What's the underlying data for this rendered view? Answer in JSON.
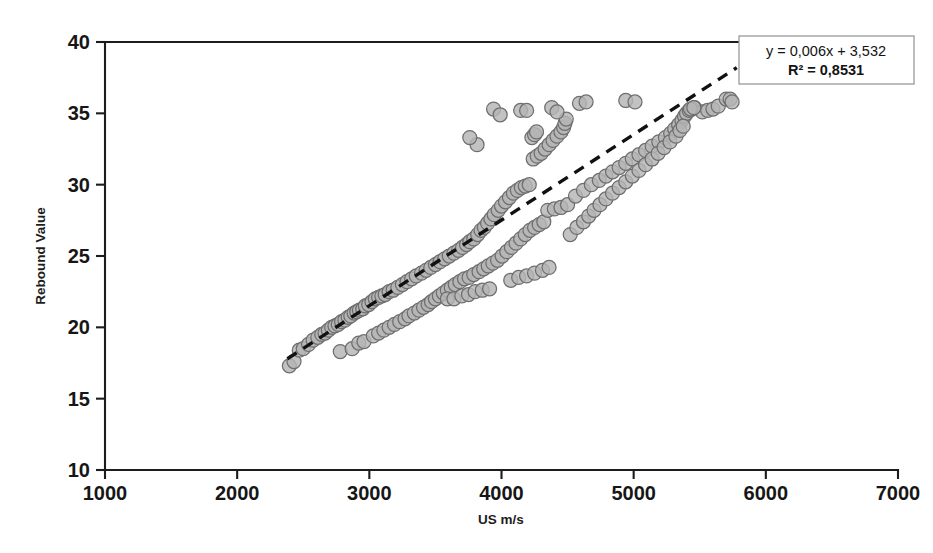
{
  "chart_data": {
    "type": "scatter",
    "title": "",
    "xlabel": "US m/s",
    "ylabel": "Rebound Value",
    "xlim": [
      1000,
      7000
    ],
    "ylim": [
      10,
      40
    ],
    "xticks": [
      1000,
      2000,
      3000,
      4000,
      5000,
      6000,
      7000
    ],
    "yticks": [
      10,
      15,
      20,
      25,
      30,
      35,
      40
    ],
    "xtick_labels": [
      "1000",
      "2000",
      "3000",
      "4000",
      "5000",
      "6000",
      "7000"
    ],
    "ytick_labels": [
      "10",
      "15",
      "20",
      "25",
      "30",
      "35",
      "40"
    ],
    "grid": false,
    "legend_position": "top-right",
    "marker": {
      "shape": "circle",
      "fill_color": "#b5b5b5",
      "edge_color": "#6e6e6e",
      "size": 7
    },
    "annotations": [
      {
        "name": "regression-equation",
        "text": "y = 0,006x + 3,532"
      },
      {
        "name": "r-squared",
        "text": "R² = 0,8531"
      }
    ],
    "trendline": {
      "type": "linear-dashed",
      "slope": 0.006,
      "intercept": 3.532,
      "color": "#111111",
      "style": "dashed",
      "x_start": 2380,
      "x_end": 5780,
      "y_start": 17.8,
      "y_end": 38.2
    },
    "series": [
      {
        "name": "Rebound vs US velocity",
        "points": [
          [
            2395,
            17.3
          ],
          [
            2430,
            17.6
          ],
          [
            2470,
            18.4
          ],
          [
            2500,
            18.5
          ],
          [
            2540,
            18.8
          ],
          [
            2575,
            19.1
          ],
          [
            2610,
            19.3
          ],
          [
            2640,
            19.5
          ],
          [
            2665,
            19.6
          ],
          [
            2690,
            19.8
          ],
          [
            2715,
            20.0
          ],
          [
            2740,
            20.1
          ],
          [
            2765,
            20.2
          ],
          [
            2790,
            20.4
          ],
          [
            2815,
            20.5
          ],
          [
            2840,
            20.7
          ],
          [
            2860,
            20.8
          ],
          [
            2885,
            21.0
          ],
          [
            2905,
            21.1
          ],
          [
            2925,
            21.2
          ],
          [
            2950,
            21.3
          ],
          [
            2970,
            21.5
          ],
          [
            2995,
            21.6
          ],
          [
            3020,
            21.8
          ],
          [
            3045,
            22.0
          ],
          [
            3070,
            22.1
          ],
          [
            3095,
            22.2
          ],
          [
            3120,
            22.3
          ],
          [
            3150,
            22.5
          ],
          [
            3180,
            22.6
          ],
          [
            3215,
            22.8
          ],
          [
            3250,
            23.0
          ],
          [
            3285,
            23.2
          ],
          [
            3320,
            23.4
          ],
          [
            3355,
            23.6
          ],
          [
            3395,
            23.8
          ],
          [
            3430,
            24.0
          ],
          [
            3465,
            24.2
          ],
          [
            3500,
            24.4
          ],
          [
            3535,
            24.6
          ],
          [
            3570,
            24.8
          ],
          [
            3605,
            25.0
          ],
          [
            3640,
            25.2
          ],
          [
            3675,
            25.4
          ],
          [
            3705,
            25.6
          ],
          [
            3735,
            25.8
          ],
          [
            3760,
            26.0
          ],
          [
            3790,
            26.2
          ],
          [
            3820,
            26.5
          ],
          [
            3845,
            26.8
          ],
          [
            3870,
            27.0
          ],
          [
            3895,
            27.3
          ],
          [
            3920,
            27.6
          ],
          [
            3945,
            27.9
          ],
          [
            3975,
            28.2
          ],
          [
            4000,
            28.5
          ],
          [
            4030,
            28.8
          ],
          [
            4060,
            29.1
          ],
          [
            4090,
            29.4
          ],
          [
            4120,
            29.6
          ],
          [
            4150,
            29.8
          ],
          [
            4180,
            29.9
          ],
          [
            4210,
            30.0
          ],
          [
            2780,
            18.3
          ],
          [
            2870,
            18.5
          ],
          [
            2920,
            18.9
          ],
          [
            2960,
            19.0
          ],
          [
            3030,
            19.4
          ],
          [
            3070,
            19.6
          ],
          [
            3110,
            19.8
          ],
          [
            3150,
            20.0
          ],
          [
            3190,
            20.2
          ],
          [
            3230,
            20.4
          ],
          [
            3270,
            20.6
          ],
          [
            3300,
            20.8
          ],
          [
            3340,
            21.0
          ],
          [
            3375,
            21.2
          ],
          [
            3410,
            21.4
          ],
          [
            3445,
            21.6
          ],
          [
            3470,
            21.8
          ],
          [
            3500,
            22.0
          ],
          [
            3530,
            22.2
          ],
          [
            3560,
            22.4
          ],
          [
            3590,
            22.6
          ],
          [
            3620,
            22.8
          ],
          [
            3650,
            23.0
          ],
          [
            3685,
            23.2
          ],
          [
            3720,
            23.4
          ],
          [
            3755,
            23.5
          ],
          [
            3790,
            23.7
          ],
          [
            3830,
            23.9
          ],
          [
            3865,
            24.1
          ],
          [
            3900,
            24.3
          ],
          [
            3935,
            24.5
          ],
          [
            3970,
            24.7
          ],
          [
            4005,
            25.0
          ],
          [
            4040,
            25.3
          ],
          [
            4075,
            25.6
          ],
          [
            4110,
            25.9
          ],
          [
            4145,
            26.2
          ],
          [
            4180,
            26.5
          ],
          [
            4215,
            26.8
          ],
          [
            4250,
            27.0
          ],
          [
            4285,
            27.2
          ],
          [
            4320,
            27.4
          ],
          [
            3590,
            22.0
          ],
          [
            3640,
            22.0
          ],
          [
            3700,
            22.2
          ],
          [
            3750,
            22.3
          ],
          [
            3800,
            22.5
          ],
          [
            3855,
            22.6
          ],
          [
            3910,
            22.7
          ],
          [
            4070,
            23.3
          ],
          [
            4130,
            23.5
          ],
          [
            4190,
            23.6
          ],
          [
            4250,
            23.8
          ],
          [
            4310,
            24.0
          ],
          [
            4360,
            24.2
          ],
          [
            4350,
            28.2
          ],
          [
            4400,
            28.3
          ],
          [
            4450,
            28.4
          ],
          [
            4500,
            28.6
          ],
          [
            4560,
            29.2
          ],
          [
            4620,
            29.6
          ],
          [
            4680,
            30.0
          ],
          [
            4740,
            30.3
          ],
          [
            4790,
            30.6
          ],
          [
            4840,
            30.9
          ],
          [
            4890,
            31.2
          ],
          [
            4940,
            31.5
          ],
          [
            4990,
            31.8
          ],
          [
            5040,
            32.1
          ],
          [
            5090,
            32.4
          ],
          [
            5140,
            32.7
          ],
          [
            5190,
            33.0
          ],
          [
            5240,
            33.3
          ],
          [
            5280,
            33.6
          ],
          [
            5310,
            33.9
          ],
          [
            5340,
            34.2
          ],
          [
            5365,
            34.5
          ],
          [
            5385,
            34.8
          ],
          [
            5400,
            35.0
          ],
          [
            5420,
            35.2
          ],
          [
            5440,
            35.3
          ],
          [
            5460,
            35.4
          ],
          [
            4520,
            26.5
          ],
          [
            4570,
            27.0
          ],
          [
            4620,
            27.4
          ],
          [
            4660,
            27.8
          ],
          [
            4700,
            28.2
          ],
          [
            4745,
            28.6
          ],
          [
            4790,
            29.0
          ],
          [
            4840,
            29.4
          ],
          [
            4890,
            29.8
          ],
          [
            4940,
            30.2
          ],
          [
            4990,
            30.6
          ],
          [
            5040,
            31.0
          ],
          [
            5090,
            31.4
          ],
          [
            5140,
            31.8
          ],
          [
            5185,
            32.2
          ],
          [
            5230,
            32.6
          ],
          [
            5275,
            33.0
          ],
          [
            5320,
            33.4
          ],
          [
            5350,
            33.8
          ],
          [
            5375,
            34.1
          ],
          [
            4240,
            31.8
          ],
          [
            4270,
            32.0
          ],
          [
            4300,
            32.2
          ],
          [
            4330,
            32.5
          ],
          [
            4360,
            32.8
          ],
          [
            4390,
            33.1
          ],
          [
            4420,
            33.4
          ],
          [
            4450,
            33.7
          ],
          [
            4470,
            34.0
          ],
          [
            4480,
            34.3
          ],
          [
            4490,
            34.6
          ],
          [
            4230,
            33.3
          ],
          [
            4250,
            33.5
          ],
          [
            4265,
            33.7
          ],
          [
            3940,
            35.3
          ],
          [
            3990,
            34.9
          ],
          [
            4145,
            35.2
          ],
          [
            4190,
            35.2
          ],
          [
            4380,
            35.4
          ],
          [
            4420,
            35.1
          ],
          [
            4590,
            35.7
          ],
          [
            4640,
            35.8
          ],
          [
            4940,
            35.9
          ],
          [
            5010,
            35.8
          ],
          [
            3815,
            32.8
          ],
          [
            3760,
            33.3
          ],
          [
            5520,
            35.1
          ],
          [
            5560,
            35.2
          ],
          [
            5600,
            35.3
          ],
          [
            5640,
            35.5
          ],
          [
            5700,
            36.0
          ],
          [
            5730,
            36.0
          ],
          [
            5745,
            35.8
          ],
          [
            5430,
            35.3
          ],
          [
            5455,
            35.4
          ]
        ]
      }
    ]
  },
  "legend": {
    "equation": "y = 0,006x + 3,532",
    "r_squared": "R² = 0,8531"
  },
  "axes": {
    "x_title": "US m/s",
    "y_title": "Rebound Value"
  }
}
